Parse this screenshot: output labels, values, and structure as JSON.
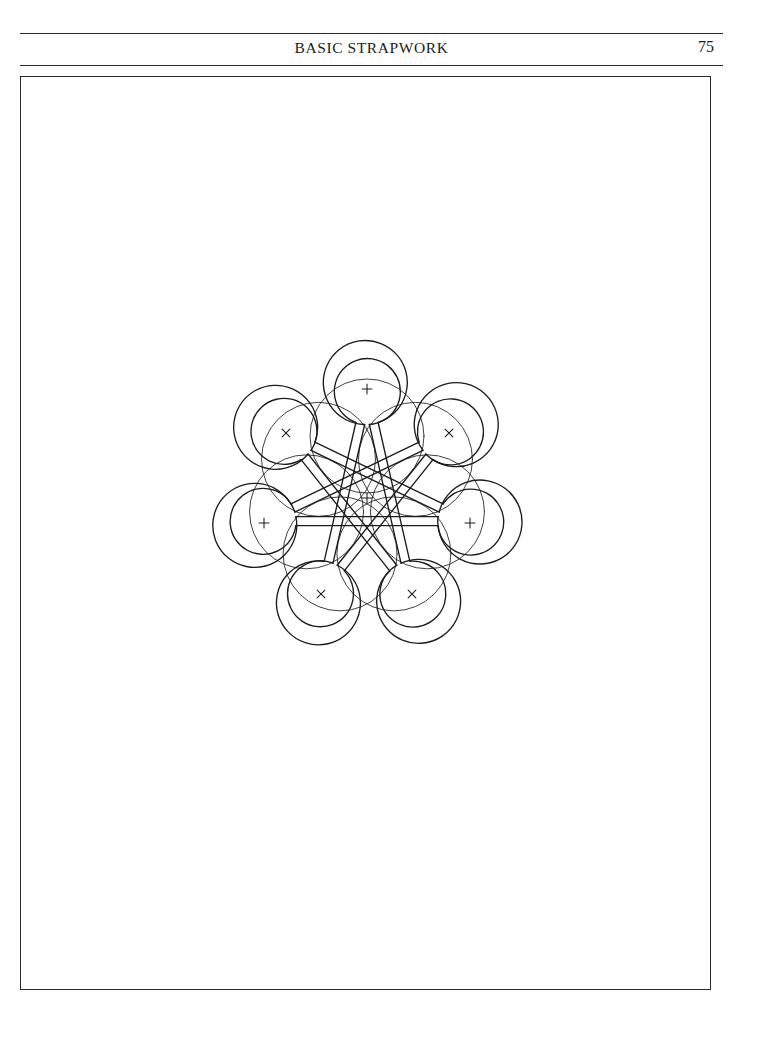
{
  "page": {
    "folio": "75",
    "running_head": "BASIC STRAPWORK",
    "background_color": "#ffffff",
    "ink_color": "#1c1c1c"
  },
  "plate": {
    "frame_border_color": "#2b2b2b",
    "caption": ""
  },
  "figure": {
    "name": "seven-point-strapwork-knot",
    "stroke_color": "#1c1c1c",
    "center": {
      "x": 366,
      "y": 497
    },
    "points": 7,
    "strap_width": 9,
    "star_skip": 3,
    "star_radius": 104,
    "loop_radius": 42,
    "construction_circle_radius": 57,
    "construction_circle_offset": 62,
    "marks": [
      {
        "label": "+",
        "kind": "plus",
        "x": 366,
        "y": 497,
        "note": "centre"
      },
      {
        "label": "+",
        "kind": "plus",
        "x": 366,
        "y": 388,
        "note": "top petal centre"
      },
      {
        "label": "x",
        "kind": "cross",
        "x": 285,
        "y": 432,
        "note": "upper-left petal centre"
      },
      {
        "label": "x",
        "kind": "cross",
        "x": 448,
        "y": 432,
        "note": "upper-right petal centre"
      },
      {
        "label": "+",
        "kind": "plus",
        "x": 263,
        "y": 522,
        "note": "mid-left petal centre"
      },
      {
        "label": "+",
        "kind": "plus",
        "x": 469,
        "y": 522,
        "note": "mid-right petal centre"
      },
      {
        "label": "x",
        "kind": "cross",
        "x": 320,
        "y": 593,
        "note": "lower-left petal centre"
      },
      {
        "label": "x",
        "kind": "cross",
        "x": 411,
        "y": 593,
        "note": "lower-right petal centre"
      }
    ],
    "bounds": {
      "left": 205,
      "top": 336,
      "right": 528,
      "bottom": 650
    }
  }
}
